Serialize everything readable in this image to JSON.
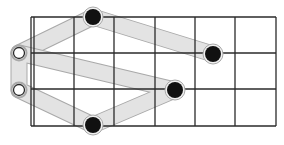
{
  "diagram": {
    "type": "fretboard-shape",
    "grid": {
      "nut_x": [
        31,
        34
      ],
      "fret_x": [
        74,
        114,
        155,
        195,
        235,
        276
      ],
      "string_y": [
        17,
        53,
        89,
        126
      ],
      "left": 31,
      "right": 276
    },
    "open_markers": [
      {
        "x": 19,
        "y": 53
      },
      {
        "x": 19,
        "y": 90
      }
    ],
    "fretted_dots": [
      {
        "x": 93,
        "y": 17
      },
      {
        "x": 213,
        "y": 54
      },
      {
        "x": 175,
        "y": 90
      },
      {
        "x": 93,
        "y": 125
      }
    ],
    "paths": [
      [
        [
          19,
          53
        ],
        [
          93,
          17
        ],
        [
          213,
          54
        ]
      ],
      [
        [
          19,
          53
        ],
        [
          175,
          90
        ],
        [
          93,
          125
        ],
        [
          19,
          90
        ],
        [
          19,
          53
        ]
      ]
    ],
    "colors": {
      "line": "#2a2a2a",
      "band": "#e6e6e6",
      "band_edge": "#a9a9a9",
      "dot": "#111111"
    }
  }
}
